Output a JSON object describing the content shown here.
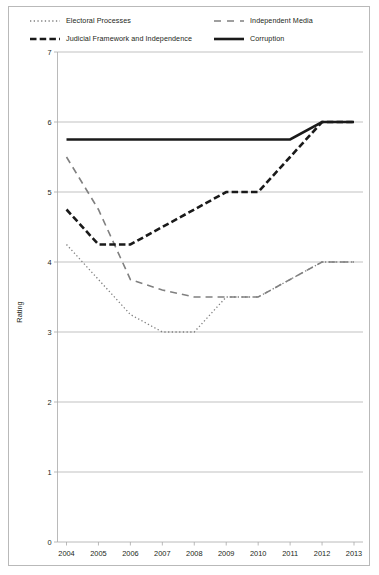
{
  "legend": {
    "items": [
      {
        "label": "Electoral Processes",
        "style": "dotted",
        "color": "#808080",
        "icon": "dotted-line-swatch"
      },
      {
        "label": "Independent Media",
        "style": "dashed-long",
        "color": "#808080",
        "icon": "dashed-line-swatch"
      },
      {
        "label": "Judicial Framework and Independence",
        "style": "dashed-bold",
        "color": "#1a1a1a",
        "icon": "bold-dashed-line-swatch"
      },
      {
        "label": "Corruption",
        "style": "solid",
        "color": "#1a1a1a",
        "icon": "solid-line-swatch"
      }
    ]
  },
  "chart_data": {
    "type": "line",
    "title": "",
    "xlabel": "",
    "ylabel": "Rating",
    "x": [
      2004,
      2005,
      2006,
      2007,
      2008,
      2009,
      2010,
      2011,
      2012,
      2013
    ],
    "xticklabels": [
      "2004",
      "2005",
      "2006",
      "2007",
      "2008",
      "2009",
      "2010",
      "2011",
      "2012",
      "2013"
    ],
    "yticklabels": [
      "0",
      "1",
      "2",
      "3",
      "4",
      "5",
      "6",
      "7"
    ],
    "ylim": [
      0,
      7
    ],
    "ytick_step": 1,
    "grid": "horizontal",
    "legend_position": "top",
    "series": [
      {
        "name": "Electoral Processes",
        "style": "dotted",
        "color": "#808080",
        "values": [
          4.25,
          3.75,
          3.25,
          3.0,
          3.0,
          3.5,
          3.5,
          3.75,
          4.0,
          4.0
        ]
      },
      {
        "name": "Independent Media",
        "style": "dashed-long",
        "color": "#808080",
        "values": [
          5.5,
          4.75,
          3.75,
          3.6,
          3.5,
          3.5,
          3.5,
          3.75,
          4.0,
          4.0
        ]
      },
      {
        "name": "Judicial Framework and Independence",
        "style": "dashed-bold",
        "color": "#1a1a1a",
        "values": [
          4.75,
          4.25,
          4.25,
          4.5,
          4.75,
          5.0,
          5.0,
          5.5,
          6.0,
          6.0
        ]
      },
      {
        "name": "Corruption",
        "style": "solid",
        "color": "#1a1a1a",
        "values": [
          5.75,
          5.75,
          5.75,
          5.75,
          5.75,
          5.75,
          5.75,
          5.75,
          6.0,
          6.0
        ]
      }
    ]
  }
}
